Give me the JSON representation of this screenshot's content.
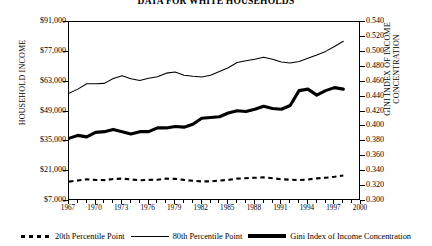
{
  "title": "DATA FOR WHITE HOUSEHOLDS",
  "axis": {
    "left_title": "HOUSEHOLD INCOME",
    "right_title_line1": "GINI INDEX OF INCOME",
    "right_title_line2": "CONCENTRATION",
    "left_ticks": [
      "$91,000",
      "$77,000",
      "$63,000",
      "$49,000",
      "$35,000",
      "$21,000",
      "$7,000"
    ],
    "right_ticks": [
      "0.540",
      "0.520",
      "0.500",
      "0.480",
      "0.460",
      "0.440",
      "0.420",
      "0.400",
      "0.380",
      "0.360",
      "0.340",
      "0.320",
      "0.300"
    ],
    "x_ticks": [
      "1967",
      "1970",
      "1973",
      "1976",
      "1979",
      "1982",
      "1985",
      "1988",
      "1991",
      "1994",
      "1997",
      "2000"
    ]
  },
  "legend": [
    {
      "label": "20th Percentile Point",
      "style": "dashed"
    },
    {
      "label": "80th Percentile Point",
      "style": "thin"
    },
    {
      "label": "Gini Index of Income Concentration",
      "style": "thick"
    }
  ],
  "chart_data": {
    "type": "line",
    "title": "DATA FOR WHITE HOUSEHOLDS",
    "xlabel": "",
    "ylabel": "HOUSEHOLD INCOME",
    "y2label": "GINI INDEX OF INCOME CONCENTRATION",
    "xlim": [
      1967,
      2000
    ],
    "ylim": [
      7000,
      91000
    ],
    "y2lim": [
      0.3,
      0.54
    ],
    "grid": false,
    "legend_position": "bottom",
    "x": [
      1967,
      1968,
      1969,
      1970,
      1971,
      1972,
      1973,
      1974,
      1975,
      1976,
      1977,
      1978,
      1979,
      1980,
      1981,
      1982,
      1983,
      1984,
      1985,
      1986,
      1987,
      1988,
      1989,
      1990,
      1991,
      1992,
      1993,
      1994,
      1995,
      1996,
      1997,
      1998
    ],
    "series": [
      {
        "name": "20th Percentile Point",
        "axis": "left",
        "style": "dashed",
        "values": [
          16100,
          16600,
          17200,
          16900,
          16800,
          17300,
          17500,
          17100,
          16700,
          16900,
          17000,
          17500,
          17400,
          16900,
          16500,
          16200,
          16200,
          16600,
          16900,
          17500,
          17700,
          17900,
          18100,
          17700,
          17200,
          17000,
          16800,
          17100,
          17600,
          17900,
          18400,
          19000
        ]
      },
      {
        "name": "80th Percentile Point",
        "axis": "left",
        "style": "thin",
        "values": [
          57500,
          59500,
          62000,
          62000,
          62200,
          64500,
          65800,
          64400,
          63500,
          64600,
          65300,
          67000,
          67500,
          66000,
          65500,
          65200,
          66000,
          67800,
          69500,
          72000,
          72800,
          73500,
          74500,
          73500,
          72200,
          71800,
          72500,
          74000,
          75500,
          77200,
          79500,
          82000
        ]
      },
      {
        "name": "Gini Index of Income Concentration",
        "axis": "right",
        "style": "thick",
        "values": [
          0.384,
          0.388,
          0.386,
          0.392,
          0.393,
          0.396,
          0.393,
          0.39,
          0.393,
          0.393,
          0.398,
          0.398,
          0.4,
          0.399,
          0.403,
          0.411,
          0.412,
          0.413,
          0.418,
          0.421,
          0.42,
          0.423,
          0.427,
          0.424,
          0.423,
          0.428,
          0.448,
          0.45,
          0.442,
          0.448,
          0.452,
          0.45
        ]
      }
    ]
  }
}
